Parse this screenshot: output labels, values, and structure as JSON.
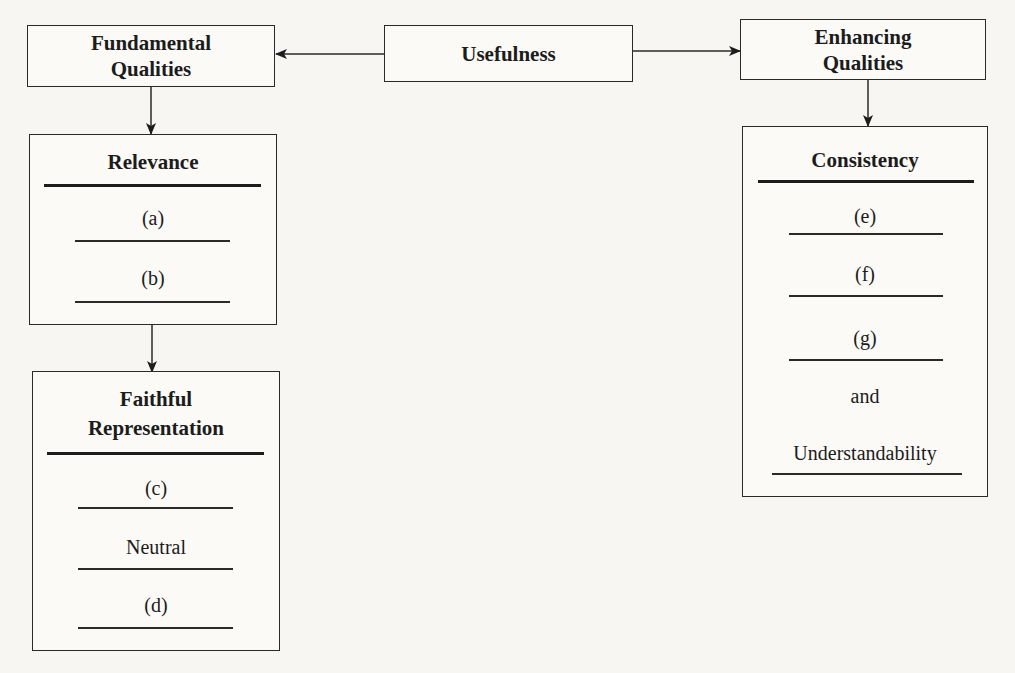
{
  "diagram": {
    "top": {
      "fundamental": {
        "line1": "Fundamental",
        "line2": "Qualities"
      },
      "usefulness": "Usefulness",
      "enhancing": {
        "line1": "Enhancing",
        "line2": "Qualities"
      }
    },
    "relevance": {
      "title": "Relevance",
      "items": [
        "(a)",
        "(b)"
      ]
    },
    "faithful": {
      "title_line1": "Faithful",
      "title_line2": "Representation",
      "items": [
        "(c)",
        "Neutral",
        "(d)"
      ]
    },
    "consistency": {
      "title": "Consistency",
      "items": [
        "(e)",
        "(f)",
        "(g)",
        "and",
        "Understandability"
      ]
    }
  }
}
